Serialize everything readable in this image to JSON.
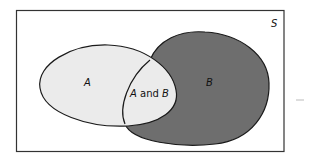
{
  "diagram": {
    "type": "venn",
    "universe_label": "S",
    "sets": [
      {
        "id": "A",
        "label": "A",
        "fill": "#ebebeb"
      },
      {
        "id": "B",
        "label": "B",
        "fill": "#6e6e6e"
      }
    ],
    "intersection": {
      "label_part1": "A",
      "label_and": " and ",
      "label_part2": "B",
      "fill": "#ebebeb"
    },
    "colors": {
      "background": "#ffffff",
      "border": "#333333",
      "outline": "#1a1a1a",
      "text": "#111111",
      "artifact": "#bbbbbb"
    }
  }
}
